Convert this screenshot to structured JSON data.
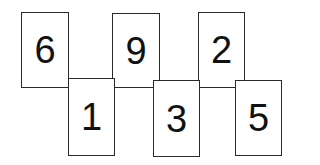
{
  "diagram": {
    "type": "number-cards",
    "cards": [
      {
        "label": "6",
        "row": "top",
        "x": 21,
        "y": 12,
        "w": 48,
        "h": 76
      },
      {
        "label": "9",
        "row": "top",
        "x": 112,
        "y": 13,
        "w": 48,
        "h": 75
      },
      {
        "label": "2",
        "row": "top",
        "x": 198,
        "y": 12,
        "w": 47,
        "h": 76
      },
      {
        "label": "1",
        "row": "bottom",
        "x": 68,
        "y": 78,
        "w": 47,
        "h": 78
      },
      {
        "label": "3",
        "row": "bottom",
        "x": 153,
        "y": 80,
        "w": 47,
        "h": 77
      },
      {
        "label": "5",
        "row": "bottom",
        "x": 235,
        "y": 80,
        "w": 47,
        "h": 76
      }
    ]
  }
}
